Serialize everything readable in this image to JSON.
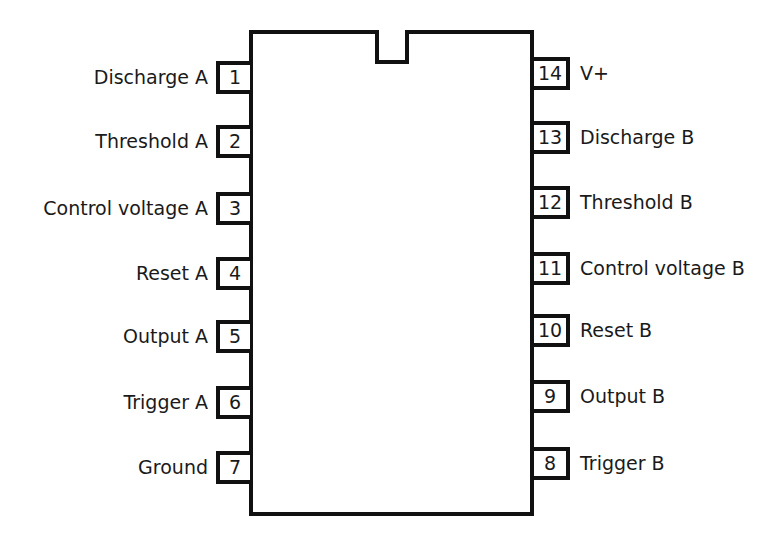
{
  "diagram": {
    "type": "ic-pinout",
    "package": "14-pin DIP",
    "pins_left": [
      {
        "number": "1",
        "label": "Discharge A",
        "y": 77
      },
      {
        "number": "2",
        "label": "Threshold A",
        "y": 141
      },
      {
        "number": "3",
        "label": "Control voltage A",
        "y": 208
      },
      {
        "number": "4",
        "label": "Reset A",
        "y": 273
      },
      {
        "number": "5",
        "label": "Output A",
        "y": 336
      },
      {
        "number": "6",
        "label": "Trigger A",
        "y": 402
      },
      {
        "number": "7",
        "label": "Ground",
        "y": 467
      }
    ],
    "pins_right": [
      {
        "number": "14",
        "label": "V+",
        "y": 73
      },
      {
        "number": "13",
        "label": "Discharge B",
        "y": 137
      },
      {
        "number": "12",
        "label": "Threshold B",
        "y": 202
      },
      {
        "number": "11",
        "label": "Control voltage B",
        "y": 268
      },
      {
        "number": "10",
        "label": "Reset B",
        "y": 330
      },
      {
        "number": "9",
        "label": "Output B",
        "y": 396
      },
      {
        "number": "8",
        "label": "Trigger B",
        "y": 463
      }
    ]
  }
}
